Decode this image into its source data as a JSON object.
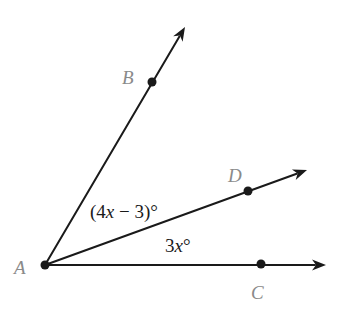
{
  "diagram": {
    "type": "angle-diagram",
    "vertex": {
      "label": "A",
      "x": 45,
      "y": 265
    },
    "points": [
      {
        "id": "B",
        "label": "B",
        "x": 152,
        "y": 82,
        "label_x": 122,
        "label_y": 84
      },
      {
        "id": "D",
        "label": "D",
        "x": 248,
        "y": 191,
        "label_x": 228,
        "label_y": 182
      },
      {
        "id": "C",
        "label": "C",
        "x": 261,
        "y": 264,
        "label_x": 251,
        "label_y": 299
      }
    ],
    "rays": [
      {
        "id": "ray-AB",
        "from": "A",
        "through": "B",
        "tip_x": 185,
        "tip_y": 27
      },
      {
        "id": "ray-AD",
        "from": "A",
        "through": "D",
        "tip_x": 307,
        "tip_y": 170
      },
      {
        "id": "ray-AC",
        "from": "A",
        "through": "C",
        "tip_x": 326,
        "tip_y": 265
      }
    ],
    "angle_labels": [
      {
        "id": "angle-BAD",
        "pre": "(4",
        "var": "x",
        "post": " − 3)°",
        "x": 90,
        "y": 218
      },
      {
        "id": "angle-DAC",
        "pre": "3",
        "var": "x",
        "post": "°",
        "x": 165,
        "y": 252
      }
    ],
    "vertex_label": {
      "text": "A",
      "x": 14,
      "y": 274
    },
    "colors": {
      "line": "#1a1a1a",
      "point_label": "#8a8a8a",
      "background": "#ffffff"
    }
  }
}
